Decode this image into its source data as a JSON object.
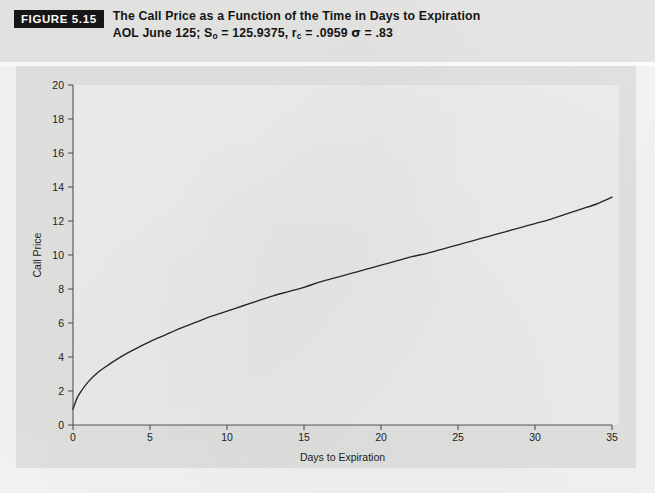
{
  "figure": {
    "badge": "FIGURE 5.15",
    "title": "The Call Price as a Function of the Time in Days to Expiration",
    "subtitle_parts": {
      "lead": "AOL June 125; S",
      "s_sub": "o",
      "mid1": " = 125.9375, r",
      "r_sub": "c",
      "mid2": " = .0959 ",
      "sigma": "σ",
      "tail": " = .83"
    },
    "subtitle_plain": "AOL June 125; So = 125.9375, rc = .0959 σ = .83"
  },
  "colors": {
    "page_background": "#f3f3f1",
    "header_background": "#e4e4e2",
    "panel_background": "#e1e1df",
    "plot_background": "#ececea",
    "badge_background": "#171717",
    "badge_text": "#ffffff",
    "axis": "#55555a",
    "curve": "#26262a",
    "text": "#141414"
  },
  "chart_data": {
    "type": "line",
    "title": "The Call Price as a Function of the Time in Days to Expiration",
    "subtitle": "AOL June 125; So = 125.9375, rc = .0959 σ = .83",
    "xlabel": "Days to Expiration",
    "ylabel": "Call Price",
    "xlim": [
      0,
      35
    ],
    "ylim": [
      0,
      20
    ],
    "xticks": [
      0,
      5,
      10,
      15,
      20,
      25,
      30,
      35
    ],
    "yticks": [
      0,
      2,
      4,
      6,
      8,
      10,
      12,
      14,
      16,
      18,
      20
    ],
    "xtick_labels": [
      "0",
      "5",
      "10",
      "15",
      "20",
      "25",
      "30",
      "35"
    ],
    "ytick_labels": [
      "0",
      "2",
      "4",
      "6",
      "8",
      "10",
      "12",
      "14",
      "16",
      "18",
      "20"
    ],
    "grid": false,
    "legend": false,
    "series": [
      {
        "name": "Call Price",
        "x": [
          0,
          0.25,
          0.5,
          1,
          1.5,
          2,
          3,
          4,
          5,
          6,
          7,
          8,
          9,
          10,
          11,
          12,
          13,
          14,
          15,
          16,
          17,
          18,
          19,
          20,
          21,
          22,
          23,
          24,
          25,
          26,
          27,
          28,
          29,
          30,
          31,
          32,
          33,
          34,
          35
        ],
        "y": [
          0.94,
          1.55,
          1.95,
          2.55,
          3.0,
          3.35,
          3.95,
          4.45,
          4.9,
          5.3,
          5.7,
          6.05,
          6.4,
          6.7,
          7.0,
          7.3,
          7.6,
          7.85,
          8.1,
          8.4,
          8.65,
          8.9,
          9.15,
          9.4,
          9.65,
          9.9,
          10.1,
          10.35,
          10.6,
          10.85,
          11.1,
          11.35,
          11.6,
          11.85,
          12.1,
          12.4,
          12.7,
          13.0,
          13.4
        ]
      }
    ]
  }
}
